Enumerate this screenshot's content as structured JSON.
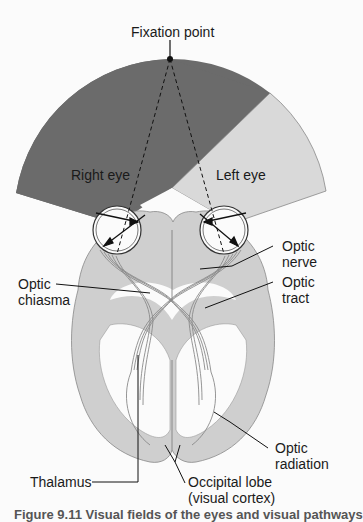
{
  "diagram": {
    "type": "anatomy",
    "colors": {
      "right_eye_field": "#6b6b6b",
      "left_eye_field": "#d9d9d9",
      "brain": "#cfcfcf",
      "background": "#fbfbfb",
      "lines": "#1a1a1a"
    },
    "labels": {
      "fixation_point": "Fixation point",
      "right_eye": "Right eye",
      "left_eye": "Left eye",
      "optic_nerve_1": "Optic",
      "optic_nerve_2": "nerve",
      "optic_chiasma_1": "Optic",
      "optic_chiasma_2": "chiasma",
      "optic_tract_1": "Optic",
      "optic_tract_2": "tract",
      "optic_radiation_1": "Optic",
      "optic_radiation_2": "radiation",
      "thalamus": "Thalamus",
      "occipital_lobe_1": "Occipital lobe",
      "occipital_lobe_2": "(visual cortex)"
    },
    "caption": "Figure 9.11 Visual fields of the eyes and visual pathways"
  }
}
